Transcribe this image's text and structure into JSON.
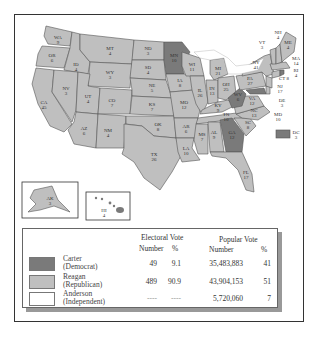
{
  "map": {
    "title": "1980 Presidential Election Results",
    "colors": {
      "carter": "#7a7a7a",
      "reagan": "#bfbfbf",
      "anderson": "#ffffff",
      "water": "#ffffff",
      "border": "#555555"
    },
    "states": [
      {
        "abbr": "WA",
        "votes": "9",
        "winner": "reagan"
      },
      {
        "abbr": "OR",
        "votes": "6",
        "winner": "reagan"
      },
      {
        "abbr": "CA",
        "votes": "45",
        "winner": "reagan"
      },
      {
        "abbr": "ID",
        "votes": "4",
        "winner": "reagan"
      },
      {
        "abbr": "NV",
        "votes": "3",
        "winner": "reagan"
      },
      {
        "abbr": "MT",
        "votes": "4",
        "winner": "reagan"
      },
      {
        "abbr": "WY",
        "votes": "3",
        "winner": "reagan"
      },
      {
        "abbr": "UT",
        "votes": "4",
        "winner": "reagan"
      },
      {
        "abbr": "AZ",
        "votes": "6",
        "winner": "reagan"
      },
      {
        "abbr": "CO",
        "votes": "7",
        "winner": "reagan"
      },
      {
        "abbr": "NM",
        "votes": "4",
        "winner": "reagan"
      },
      {
        "abbr": "ND",
        "votes": "3",
        "winner": "reagan"
      },
      {
        "abbr": "SD",
        "votes": "4",
        "winner": "reagan"
      },
      {
        "abbr": "NE",
        "votes": "5",
        "winner": "reagan"
      },
      {
        "abbr": "KS",
        "votes": "7",
        "winner": "reagan"
      },
      {
        "abbr": "OK",
        "votes": "8",
        "winner": "reagan"
      },
      {
        "abbr": "TX",
        "votes": "26",
        "winner": "reagan"
      },
      {
        "abbr": "MN",
        "votes": "10",
        "winner": "carter"
      },
      {
        "abbr": "IA",
        "votes": "8",
        "winner": "reagan"
      },
      {
        "abbr": "MO",
        "votes": "12",
        "winner": "reagan"
      },
      {
        "abbr": "AR",
        "votes": "6",
        "winner": "reagan"
      },
      {
        "abbr": "LA",
        "votes": "10",
        "winner": "reagan"
      },
      {
        "abbr": "WI",
        "votes": "11",
        "winner": "reagan"
      },
      {
        "abbr": "IL",
        "votes": "26",
        "winner": "reagan"
      },
      {
        "abbr": "MI",
        "votes": "21",
        "winner": "reagan"
      },
      {
        "abbr": "IN",
        "votes": "13",
        "winner": "reagan"
      },
      {
        "abbr": "OH",
        "votes": "25",
        "winner": "reagan"
      },
      {
        "abbr": "KY",
        "votes": "9",
        "winner": "reagan"
      },
      {
        "abbr": "TN",
        "votes": "10",
        "winner": "reagan"
      },
      {
        "abbr": "MS",
        "votes": "7",
        "winner": "reagan"
      },
      {
        "abbr": "AL",
        "votes": "9",
        "winner": "reagan"
      },
      {
        "abbr": "GA",
        "votes": "12",
        "winner": "carter"
      },
      {
        "abbr": "FL",
        "votes": "17",
        "winner": "reagan"
      },
      {
        "abbr": "SC",
        "votes": "8",
        "winner": "reagan"
      },
      {
        "abbr": "NC",
        "votes": "13",
        "winner": "reagan"
      },
      {
        "abbr": "VA",
        "votes": "12",
        "winner": "reagan"
      },
      {
        "abbr": "WV",
        "votes": "6",
        "winner": "carter"
      },
      {
        "abbr": "PA",
        "votes": "27",
        "winner": "reagan"
      },
      {
        "abbr": "NY",
        "votes": "41",
        "winner": "reagan"
      },
      {
        "abbr": "VT",
        "votes": "3",
        "winner": "reagan"
      },
      {
        "abbr": "NH",
        "votes": "4",
        "winner": "reagan"
      },
      {
        "abbr": "ME",
        "votes": "4",
        "winner": "reagan"
      },
      {
        "abbr": "MA",
        "votes": "14",
        "winner": "reagan"
      },
      {
        "abbr": "RI",
        "votes": "4",
        "winner": "carter"
      },
      {
        "abbr": "CT",
        "votes": "8",
        "winner": "reagan"
      },
      {
        "abbr": "NJ",
        "votes": "17",
        "winner": "reagan"
      },
      {
        "abbr": "DE",
        "votes": "3",
        "winner": "reagan"
      },
      {
        "abbr": "MD",
        "votes": "10",
        "winner": "carter"
      },
      {
        "abbr": "DC",
        "votes": "3",
        "winner": "carter"
      },
      {
        "abbr": "AK",
        "votes": "3",
        "winner": "reagan"
      },
      {
        "abbr": "HI",
        "votes": "4",
        "winner": "carter"
      }
    ]
  },
  "legend": {
    "headers": {
      "electoral": "Electoral Vote",
      "popular": "Popular Vote",
      "number": "Number",
      "percent": "%"
    },
    "rows": [
      {
        "name": "Carter",
        "party": "(Democrat)",
        "ev_number": "49",
        "ev_percent": "9.1",
        "pv_number": "35,483,883",
        "pv_percent": "41",
        "color": "#7a7a7a"
      },
      {
        "name": "Reagan",
        "party": "(Republican)",
        "ev_number": "489",
        "ev_percent": "90.9",
        "pv_number": "43,904,153",
        "pv_percent": "51",
        "color": "#bfbfbf"
      },
      {
        "name": "Anderson",
        "party": "(Independent)",
        "ev_number": "----",
        "ev_percent": "----",
        "pv_number": "5,720,060",
        "pv_percent": "7",
        "color": "#ffffff"
      }
    ]
  }
}
